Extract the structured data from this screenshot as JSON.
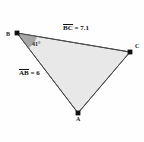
{
  "figure": {
    "type": "triangle-diagram",
    "background_color": "#fefefe",
    "fill_color": "#e8e8e8",
    "stroke_color": "#4a4a4a",
    "angle_wedge_color": "#9a9a9a",
    "vertex_marker_color": "#111111"
  },
  "vertices": [
    {
      "id": "B",
      "label": "B",
      "x": 17,
      "y": 33
    },
    {
      "id": "C",
      "label": "C",
      "x": 130,
      "y": 52
    },
    {
      "id": "A",
      "label": "A",
      "x": 78,
      "y": 113
    }
  ],
  "angles": [
    {
      "at": "B",
      "label": "41°",
      "value": 41,
      "unit": "degrees"
    }
  ],
  "measurements": [
    {
      "id": "bc",
      "segment": "BC",
      "separator": " = ",
      "value": "7.1"
    },
    {
      "id": "ab",
      "segment": "AB",
      "separator": " = ",
      "value": "6"
    }
  ]
}
